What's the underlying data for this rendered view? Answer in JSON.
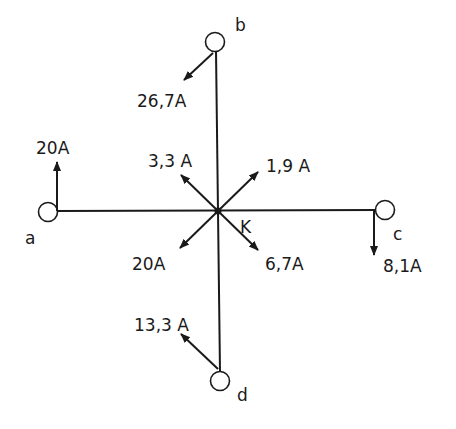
{
  "diagram": {
    "type": "current-node-diagram",
    "center_node": {
      "label": "K",
      "x": 218,
      "y": 211
    },
    "terminals": [
      {
        "id": "a",
        "label": "a",
        "x": 48,
        "y": 212
      },
      {
        "id": "b",
        "label": "b",
        "x": 215,
        "y": 42
      },
      {
        "id": "c",
        "label": "c",
        "x": 385,
        "y": 210
      },
      {
        "id": "d",
        "label": "d",
        "x": 220,
        "y": 381
      }
    ],
    "branch_currents": [
      {
        "at": "a",
        "value": "20A",
        "direction": "up"
      },
      {
        "at": "b",
        "value": "26,7A",
        "direction": "down-left"
      },
      {
        "at": "c",
        "value": "8,1A",
        "direction": "down"
      },
      {
        "at": "d",
        "value": "13,3 A",
        "direction": "up-left"
      }
    ],
    "node_currents": [
      {
        "value": "3,3 A",
        "direction": "up-left"
      },
      {
        "value": "1,9 A",
        "direction": "up-right"
      },
      {
        "value": "20A",
        "direction": "down-left"
      },
      {
        "value": "6,7A",
        "direction": "down-right"
      }
    ],
    "colors": {
      "ink": "#1a1a1a",
      "background": "#ffffff"
    }
  }
}
